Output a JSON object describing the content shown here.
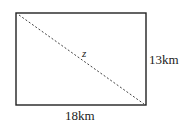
{
  "diagram": {
    "shape": "rectangle",
    "diagonal_label": "z",
    "height_label": "13km",
    "width_label": "18km",
    "colors": {
      "stroke": "#222222",
      "background": "#ffffff"
    }
  }
}
